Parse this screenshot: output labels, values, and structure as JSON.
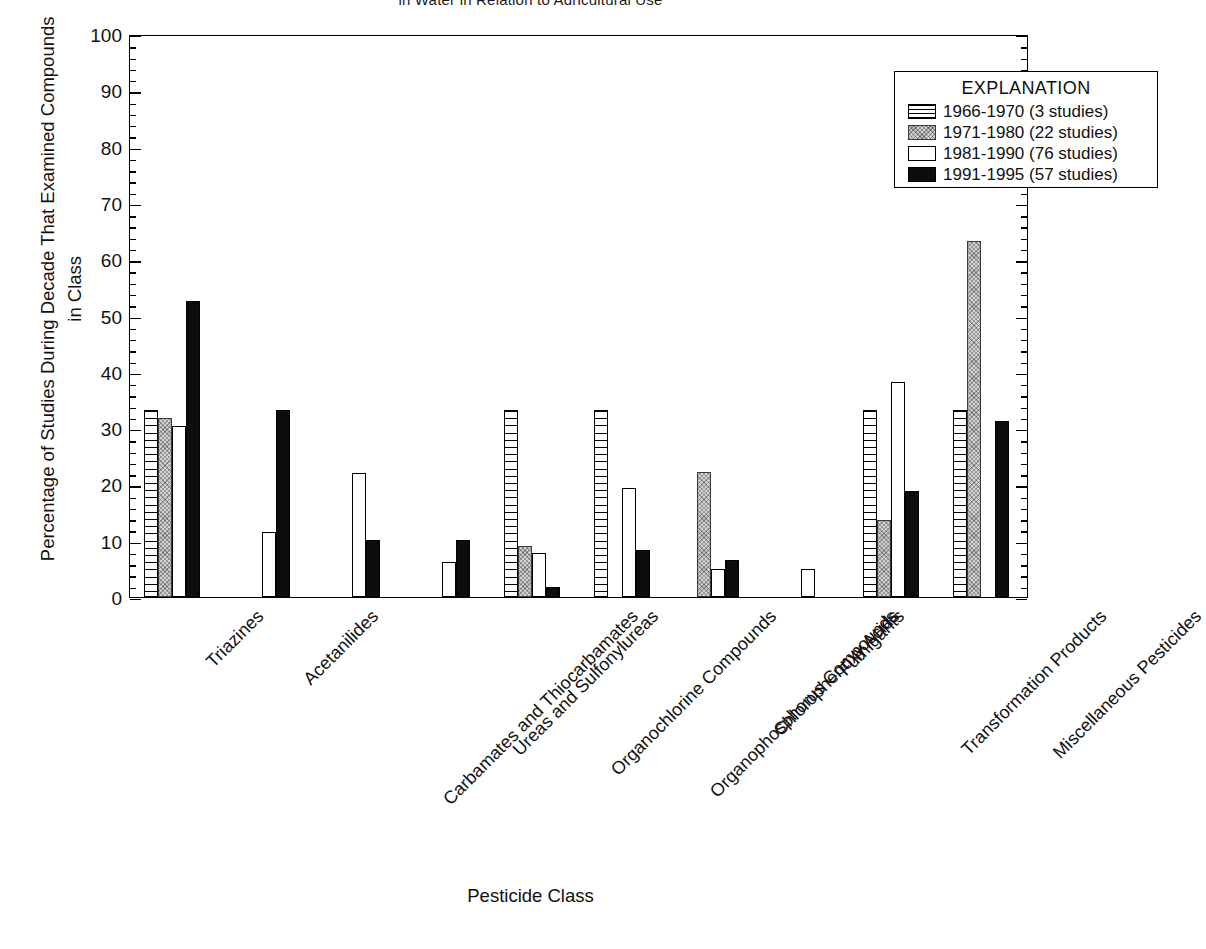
{
  "figure": {
    "top_title_partial": "in Water in Relation to Agricultural Use",
    "legend_title": "EXPLANATION"
  },
  "chart_data": {
    "type": "bar",
    "title": "",
    "xlabel": "Pesticide Class",
    "ylabel": "Percentage of Studies During Decade That Examined Compounds in Class",
    "ylim": [
      0,
      100
    ],
    "ytick_labels": [
      "0",
      "10",
      "20",
      "30",
      "40",
      "50",
      "60",
      "70",
      "80",
      "90",
      "100"
    ],
    "ytick_values": [
      0,
      10,
      20,
      30,
      40,
      50,
      60,
      70,
      80,
      90,
      100
    ],
    "ytick_minor_step": 2,
    "grid": false,
    "legend_position": "top-right inside plot",
    "categories": [
      "Triazines",
      "Acetanilides",
      "Carbamates and Thiocarbamates",
      "Ureas and Sulfonylureas",
      "Organochlorine Compounds",
      "Organophosphorus Compounds",
      "Chlorophenoxy Acids",
      "Fumigants",
      "Transformation Products",
      "Miscellaneous Pesticides"
    ],
    "series": [
      {
        "name": "1966-1970 (3 studies)",
        "pattern": "hatch",
        "values": [
          33.3,
          0,
          0,
          0,
          33.3,
          33.3,
          0,
          0,
          33.3,
          33.3
        ]
      },
      {
        "name": "1971-1980 (22 studies)",
        "pattern": "gray",
        "values": [
          31.8,
          0,
          0,
          0,
          9.1,
          0,
          22.2,
          0,
          13.6,
          63.2
        ]
      },
      {
        "name": "1981-1990 (76 studies)",
        "pattern": "white",
        "values": [
          30.3,
          11.5,
          22.0,
          6.2,
          7.9,
          19.3,
          5.0,
          5.0,
          38.2,
          0
        ]
      },
      {
        "name": "1991-1995 (57 studies)",
        "pattern": "black",
        "values": [
          52.6,
          33.3,
          10.2,
          10.2,
          1.7,
          8.4,
          6.6,
          0,
          18.8,
          31.3
        ]
      }
    ]
  },
  "legend": {
    "title": "EXPLANATION",
    "entries": [
      {
        "label": "1966-1970 (3 studies)",
        "pattern": "hatch"
      },
      {
        "label": "1971-1980 (22 studies)",
        "pattern": "gray"
      },
      {
        "label": "1981-1990 (76 studies)",
        "pattern": "white"
      },
      {
        "label": "1991-1995 (57 studies)",
        "pattern": "black"
      }
    ]
  },
  "colors": {
    "ink": "#000000",
    "hatch_fill": "#ffffff",
    "gray_fill": "#d2d2d2",
    "white_fill": "#ffffff",
    "black_fill": "#0d0d0d",
    "background": "#ffffff"
  }
}
